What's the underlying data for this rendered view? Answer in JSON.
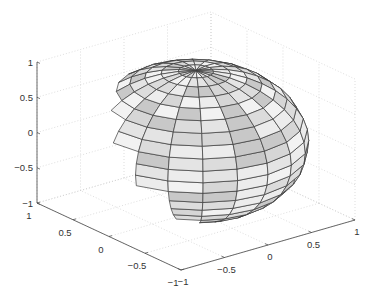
{
  "chart_data": {
    "type": "surface3d",
    "title": "",
    "xlabel": "",
    "ylabel": "",
    "zlabel": "",
    "surface": "unit sphere (20x20 faces)",
    "xlim": [
      -1,
      1
    ],
    "ylim": [
      -1,
      1
    ],
    "zlim": [
      -1,
      1
    ],
    "x_ticks": [
      "-1",
      "-0.5",
      "0",
      "0.5",
      "1"
    ],
    "y_ticks": [
      "1",
      "0.5",
      "0",
      "-0.5",
      "-1"
    ],
    "z_ticks": [
      "1",
      "0.5",
      "0",
      "-0.5",
      "-1"
    ],
    "grid": true,
    "n_faces": 20,
    "colormap": "gray",
    "edge_color": "#3a3a3a",
    "highlighted_faces": [
      {
        "row": 6,
        "col": 14,
        "color": "#6e6e6e"
      },
      {
        "row": 7,
        "col": 14,
        "color": "#a0a0a0"
      },
      {
        "row": 5,
        "col": 14,
        "color": "#b4b4b4"
      }
    ]
  },
  "projection": {
    "origin": [
      196,
      141
    ],
    "x_unit": [
      87,
      -25
    ],
    "y_unit": [
      -72,
      -33.5
    ],
    "z_unit": [
      0,
      -70.5
    ]
  },
  "palette": [
    "#f2f2f2",
    "#e4e4e4",
    "#d6d6d6",
    "#c8c8c8",
    "#ececec",
    "#dcdcdc"
  ]
}
